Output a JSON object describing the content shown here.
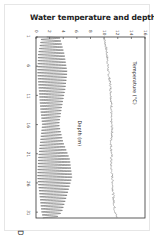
{
  "chart_data": {
    "type": "line",
    "title": "Water temperature and depth",
    "xlabel": "Days in May",
    "ylabel": "",
    "orientation": "rotated-90",
    "x_ticks": [
      1,
      6,
      11,
      16,
      21,
      26,
      31
    ],
    "xlim": [
      1,
      32
    ],
    "y_ticks": [
      0,
      2,
      4,
      6,
      8,
      10,
      12,
      14,
      16
    ],
    "ylim": [
      0,
      16
    ],
    "grid": false,
    "annotations": [
      "Temperature (°C)",
      "Depth (m)"
    ],
    "series": [
      {
        "name": "Temperature (°C)",
        "color": "#888888",
        "x": [
          1,
          3,
          5,
          7,
          9,
          11,
          13,
          15,
          17,
          19,
          21,
          23,
          25,
          27,
          29,
          31,
          32
        ],
        "values": [
          10.0,
          10.3,
          10.5,
          10.6,
          10.9,
          11.0,
          11.1,
          11.0,
          11.2,
          11.0,
          11.1,
          11.0,
          11.2,
          11.3,
          11.4,
          11.6,
          11.9
        ]
      },
      {
        "name": "Depth (m)",
        "color": "#555555",
        "pattern": "semi-diurnal tidal oscillation",
        "x": [
          1,
          4,
          7,
          10,
          13,
          16,
          19,
          22,
          25,
          28,
          31,
          32
        ],
        "min_values": [
          0.8,
          0.3,
          0.2,
          0.4,
          0.6,
          0.9,
          0.6,
          0.3,
          0.2,
          0.5,
          0.8,
          1.0
        ],
        "max_values": [
          3.5,
          4.2,
          4.6,
          4.3,
          3.8,
          3.4,
          4.0,
          5.0,
          5.3,
          4.6,
          3.8,
          3.0
        ]
      }
    ]
  },
  "title": "Water temperature and depth",
  "axis": {
    "days_label": "Days in May",
    "temperature_label": "Temperature (°C)",
    "depth_label": "Depth (m)",
    "top_ticks": [
      "0",
      "2",
      "4",
      "6",
      "8",
      "10",
      "12",
      "14",
      "16"
    ],
    "left_ticks": [
      "1",
      "6",
      "11",
      "16",
      "21",
      "26",
      "31"
    ]
  }
}
